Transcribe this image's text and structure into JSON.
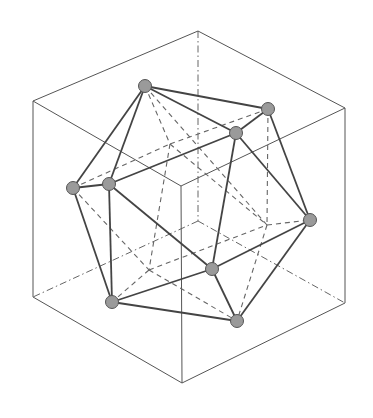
{
  "diagram": {
    "colors": {
      "background": "#ffffff",
      "edge": "#444444",
      "vertex_fill": "#9a9a9a"
    },
    "cube": {
      "corners": {
        "top": "back-top",
        "left_top": "left-top",
        "right_top": "right-top",
        "front_top": "front-top",
        "left_bottom": "left-bottom",
        "right_bottom": "right-bottom",
        "front_bottom": "front-bottom",
        "back_bottom": "back-bottom"
      },
      "visible_edges": [
        [
          "top",
          "left_top"
        ],
        [
          "top",
          "right_top"
        ],
        [
          "left_top",
          "front_top"
        ],
        [
          "right_top",
          "front_top"
        ],
        [
          "left_top",
          "left_bottom"
        ],
        [
          "right_top",
          "right_bottom"
        ],
        [
          "front_top",
          "front_bottom"
        ],
        [
          "left_bottom",
          "front_bottom"
        ],
        [
          "right_bottom",
          "front_bottom"
        ]
      ],
      "hidden_edges": [
        [
          "top",
          "back_bottom"
        ],
        [
          "back_bottom",
          "left_bottom"
        ],
        [
          "back_bottom",
          "right_bottom"
        ]
      ]
    },
    "icosahedron": {
      "visible_vertices": [
        "A",
        "B",
        "C",
        "D",
        "E",
        "F",
        "G",
        "H",
        "I"
      ],
      "hidden_vertices": [
        "J",
        "K",
        "L"
      ],
      "visible_edges": [
        [
          "A",
          "B"
        ],
        [
          "A",
          "C"
        ],
        [
          "A",
          "D"
        ],
        [
          "A",
          "E"
        ],
        [
          "B",
          "C"
        ],
        [
          "B",
          "F"
        ],
        [
          "C",
          "E"
        ],
        [
          "C",
          "G"
        ],
        [
          "C",
          "F"
        ],
        [
          "D",
          "E"
        ],
        [
          "D",
          "H"
        ],
        [
          "E",
          "H"
        ],
        [
          "E",
          "G"
        ],
        [
          "G",
          "F"
        ],
        [
          "G",
          "H"
        ],
        [
          "G",
          "I"
        ],
        [
          "H",
          "I"
        ],
        [
          "F",
          "I"
        ]
      ],
      "hidden_edges": [
        [
          "A",
          "J"
        ],
        [
          "A",
          "L"
        ],
        [
          "D",
          "J"
        ],
        [
          "D",
          "K"
        ],
        [
          "B",
          "J"
        ],
        [
          "B",
          "L"
        ],
        [
          "J",
          "K"
        ],
        [
          "J",
          "L"
        ],
        [
          "K",
          "L"
        ],
        [
          "K",
          "H"
        ],
        [
          "K",
          "I"
        ],
        [
          "L",
          "F"
        ],
        [
          "L",
          "I"
        ]
      ]
    }
  }
}
